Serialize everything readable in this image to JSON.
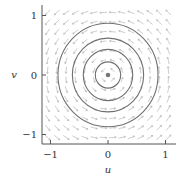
{
  "chart_data": {
    "type": "vector-field-phase-portrait",
    "title": "",
    "xlabel": "u",
    "ylabel": "v",
    "xlim": [
      -1.1,
      1.15
    ],
    "ylim": [
      -1.15,
      1.15
    ],
    "xticks": [
      -1,
      0,
      1
    ],
    "yticks": [
      -1,
      0,
      1
    ],
    "xtick_labels": [
      "−1",
      "0",
      "1"
    ],
    "ytick_labels": [
      "−1",
      "0",
      "1"
    ],
    "grid": false,
    "vector_field": {
      "description": "counterclockwise rotation field (du/dt = -v, dv/dt = u)",
      "grid_n": 14,
      "range": [
        -1.05,
        1.05
      ],
      "color": "#b8b8b8"
    },
    "trajectories": {
      "type": "circles",
      "center": [
        0,
        0
      ],
      "radii": [
        0.22,
        0.43,
        0.62,
        0.87
      ],
      "color": "#707070"
    },
    "equilibrium": {
      "u": 0,
      "v": 0,
      "color": "#777777"
    }
  },
  "colors": {
    "axis": "#555555",
    "tick_text": "#333333"
  }
}
